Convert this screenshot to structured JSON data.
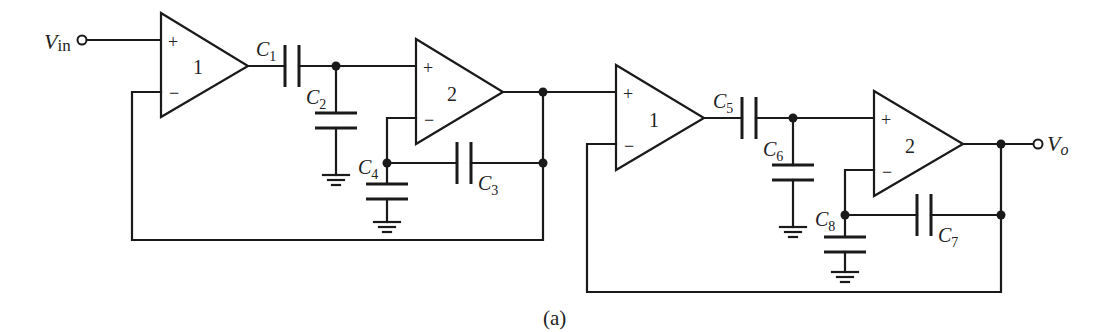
{
  "figure": {
    "caption": "(a)",
    "input_label": "V",
    "input_sub": "in",
    "output_label": "V",
    "output_sub": "o",
    "opamps": [
      {
        "id": "opamp-1a",
        "label": "1",
        "plus": "+",
        "minus": "−"
      },
      {
        "id": "opamp-2a",
        "label": "2",
        "plus": "+",
        "minus": "−"
      },
      {
        "id": "opamp-1b",
        "label": "1",
        "plus": "+",
        "minus": "−"
      },
      {
        "id": "opamp-2b",
        "label": "2",
        "plus": "+",
        "minus": "−"
      }
    ],
    "capacitors": [
      {
        "name": "C",
        "sub": "1"
      },
      {
        "name": "C",
        "sub": "2"
      },
      {
        "name": "C",
        "sub": "3"
      },
      {
        "name": "C",
        "sub": "4"
      },
      {
        "name": "C",
        "sub": "5"
      },
      {
        "name": "C",
        "sub": "6"
      },
      {
        "name": "C",
        "sub": "7"
      },
      {
        "name": "C",
        "sub": "8"
      }
    ]
  }
}
